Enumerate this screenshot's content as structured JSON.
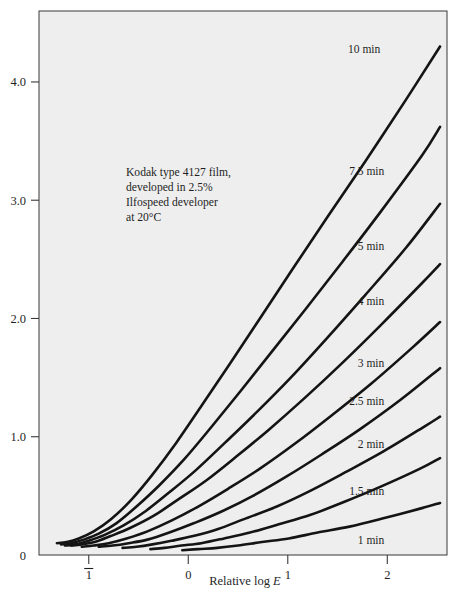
{
  "chart_data": {
    "type": "line",
    "title": "",
    "subtitle": "",
    "xlabel": "Relative log E",
    "ylabel": "",
    "xlim": [
      -1.5,
      2.6
    ],
    "ylim": [
      0,
      4.6
    ],
    "grid": false,
    "legend_position": "inline-right-of-curves",
    "x_ticks": [
      {
        "value": -1,
        "label": "1",
        "overbar": true
      },
      {
        "value": 0,
        "label": "0",
        "overbar": false
      },
      {
        "value": 1,
        "label": "1",
        "overbar": false
      },
      {
        "value": 2,
        "label": "2",
        "overbar": false
      }
    ],
    "y_ticks": [
      {
        "value": 0,
        "label": "0"
      },
      {
        "value": 1,
        "label": "1.0"
      },
      {
        "value": 2,
        "label": "2.0"
      },
      {
        "value": 3,
        "label": "3.0"
      },
      {
        "value": 4,
        "label": "4.0"
      }
    ],
    "annotation": {
      "line1": "Kodak type 4127 film,",
      "line2": "developed in 2.5%",
      "line3": "Ilfospeed developer",
      "line4": "at 20°C"
    },
    "series": [
      {
        "name": "10 min",
        "label": "10 min",
        "label_x": 1.93,
        "label_y": 4.28,
        "x": [
          -1.32,
          -1.22,
          -1.1,
          -0.95,
          -0.78,
          -0.58,
          -0.36,
          -0.12,
          0.14,
          0.42,
          0.72,
          1.05,
          1.4,
          1.78,
          2.18,
          2.53
        ],
        "y": [
          0.1,
          0.11,
          0.14,
          0.2,
          0.3,
          0.46,
          0.68,
          0.95,
          1.27,
          1.62,
          2.0,
          2.42,
          2.86,
          3.33,
          3.84,
          4.3
        ]
      },
      {
        "name": "7.5 min",
        "label": "7.5 min",
        "label_x": 1.97,
        "label_y": 3.25,
        "x": [
          -1.28,
          -1.18,
          -1.05,
          -0.9,
          -0.72,
          -0.52,
          -0.29,
          -0.04,
          0.23,
          0.52,
          0.84,
          1.18,
          1.55,
          1.94,
          2.35,
          2.53
        ],
        "y": [
          0.09,
          0.1,
          0.13,
          0.18,
          0.27,
          0.41,
          0.59,
          0.81,
          1.08,
          1.38,
          1.72,
          2.08,
          2.48,
          2.91,
          3.38,
          3.62
        ]
      },
      {
        "name": "5 min",
        "label": "5 min",
        "label_x": 1.97,
        "label_y": 2.61,
        "x": [
          -1.24,
          -1.13,
          -1.0,
          -0.84,
          -0.65,
          -0.43,
          -0.19,
          0.08,
          0.37,
          0.69,
          1.03,
          1.39,
          1.78,
          2.19,
          2.53
        ],
        "y": [
          0.08,
          0.09,
          0.12,
          0.17,
          0.25,
          0.37,
          0.53,
          0.72,
          0.95,
          1.21,
          1.5,
          1.83,
          2.2,
          2.6,
          2.97
        ]
      },
      {
        "name": "4 min",
        "label": "4 min",
        "label_x": 1.97,
        "label_y": 2.15,
        "x": [
          -1.18,
          -1.07,
          -0.94,
          -0.78,
          -0.58,
          -0.35,
          -0.1,
          0.18,
          0.48,
          0.81,
          1.16,
          1.53,
          1.93,
          2.35,
          2.53
        ],
        "y": [
          0.08,
          0.09,
          0.11,
          0.16,
          0.23,
          0.33,
          0.47,
          0.63,
          0.83,
          1.06,
          1.32,
          1.61,
          1.94,
          2.3,
          2.46
        ]
      },
      {
        "name": "3 min",
        "label": "3 min",
        "label_x": 1.97,
        "label_y": 1.62,
        "x": [
          -1.07,
          -0.95,
          -0.8,
          -0.62,
          -0.41,
          -0.17,
          0.1,
          0.4,
          0.72,
          1.07,
          1.44,
          1.84,
          2.26,
          2.53
        ],
        "y": [
          0.07,
          0.08,
          0.1,
          0.14,
          0.2,
          0.29,
          0.41,
          0.56,
          0.73,
          0.94,
          1.18,
          1.45,
          1.76,
          1.97
        ]
      },
      {
        "name": "2.5 min",
        "label": "2.5 min",
        "label_x": 1.97,
        "label_y": 1.3,
        "x": [
          -0.9,
          -0.76,
          -0.6,
          -0.41,
          -0.19,
          0.06,
          0.34,
          0.65,
          0.98,
          1.34,
          1.72,
          2.13,
          2.53
        ],
        "y": [
          0.07,
          0.08,
          0.1,
          0.13,
          0.19,
          0.27,
          0.37,
          0.5,
          0.66,
          0.85,
          1.06,
          1.31,
          1.58
        ]
      },
      {
        "name": "2 min",
        "label": "2 min",
        "label_x": 1.97,
        "label_y": 0.94,
        "x": [
          -0.66,
          -0.52,
          -0.36,
          -0.17,
          0.05,
          0.3,
          0.58,
          0.89,
          1.22,
          1.58,
          1.97,
          2.38,
          2.53
        ],
        "y": [
          0.06,
          0.07,
          0.09,
          0.12,
          0.16,
          0.22,
          0.31,
          0.41,
          0.54,
          0.7,
          0.88,
          1.09,
          1.17
        ]
      },
      {
        "name": "1.5 min",
        "label": "1.5 min",
        "label_x": 1.97,
        "label_y": 0.54,
        "x": [
          -0.38,
          -0.24,
          -0.07,
          0.13,
          0.36,
          0.62,
          0.91,
          1.23,
          1.57,
          1.94,
          2.33,
          2.53
        ],
        "y": [
          0.05,
          0.06,
          0.08,
          0.1,
          0.14,
          0.19,
          0.26,
          0.34,
          0.45,
          0.58,
          0.73,
          0.82
        ]
      },
      {
        "name": "1 min",
        "label": "1 min",
        "label_x": 1.97,
        "label_y": 0.13,
        "x": [
          -0.06,
          0.1,
          0.29,
          0.5,
          0.74,
          1.01,
          1.3,
          1.62,
          1.96,
          2.32,
          2.53
        ],
        "y": [
          0.04,
          0.05,
          0.06,
          0.08,
          0.11,
          0.14,
          0.19,
          0.24,
          0.31,
          0.39,
          0.44
        ]
      }
    ]
  }
}
